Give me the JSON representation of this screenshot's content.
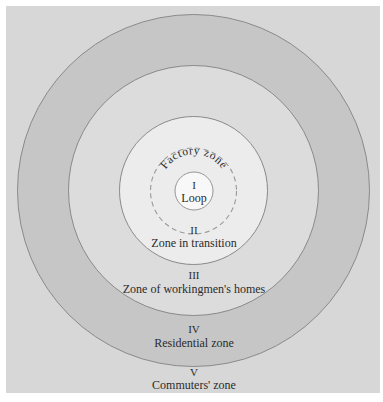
{
  "diagram": {
    "colors": {
      "background_square": "#d7d7d7",
      "zone_v": "#d7d7d7",
      "zone_iv": "#c6c6c6",
      "zone_iii": "#dcdcdc",
      "zone_ii": "#ececec",
      "zone_i": "#f8f8f8",
      "ring_stroke": "#8a8a8a",
      "dashed_stroke": "#9a9a9a",
      "text": "#2b2b2b"
    },
    "zones": [
      {
        "numeral": "I",
        "label": "Loop"
      },
      {
        "numeral": "II",
        "label": "Zone in transition"
      },
      {
        "numeral": "III",
        "label": "Zone of workingmen's homes"
      },
      {
        "numeral": "IV",
        "label": "Residential zone"
      },
      {
        "numeral": "V",
        "label": "Commuters' zone"
      }
    ],
    "factory_zone_label": "Factory zone"
  }
}
